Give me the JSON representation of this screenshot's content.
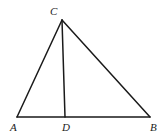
{
  "diagram": {
    "type": "geometry-triangle",
    "points": {
      "A": {
        "label": "A",
        "x": 17,
        "y": 117,
        "label_x": 10,
        "label_y": 131
      },
      "B": {
        "label": "B",
        "x": 150,
        "y": 117,
        "label_x": 150,
        "label_y": 131
      },
      "C": {
        "label": "C",
        "x": 62,
        "y": 20,
        "label_x": 50,
        "label_y": 15
      },
      "D": {
        "label": "D",
        "x": 65,
        "y": 117,
        "label_x": 62,
        "label_y": 131
      }
    },
    "segments": [
      {
        "from": "A",
        "to": "B",
        "name": "AB"
      },
      {
        "from": "A",
        "to": "C",
        "name": "AC"
      },
      {
        "from": "B",
        "to": "C",
        "name": "BC"
      },
      {
        "from": "C",
        "to": "D",
        "name": "CD"
      }
    ],
    "stroke_color": "#1a1a1a",
    "background": "#ffffff"
  }
}
